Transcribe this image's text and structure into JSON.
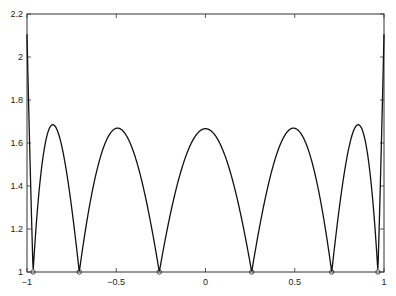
{
  "chart_data": {
    "type": "line",
    "title": "",
    "xlabel": "",
    "ylabel": "",
    "xlim": [
      -1,
      1
    ],
    "ylim": [
      1,
      2.2
    ],
    "grid": false,
    "legend": null,
    "x_ticks": [
      "-1",
      "-0.5",
      "0",
      "0.5",
      "1"
    ],
    "x_tick_values": [
      -1,
      -0.5,
      0,
      0.5,
      1
    ],
    "y_ticks": [
      "1",
      "1.2",
      "1.4",
      "1.6",
      "1.8",
      "2",
      "2.2"
    ],
    "y_tick_values": [
      1,
      1.2,
      1.4,
      1.6,
      1.8,
      2,
      2.2
    ],
    "series": [
      {
        "name": "Lebesgue function (Chebyshev roots, 6 nodes)",
        "kind": "curve",
        "color": "#000000",
        "nodes": [
          -0.9659,
          -0.7071,
          -0.2588,
          0.2588,
          0.7071,
          0.9659
        ],
        "approx_points": [
          {
            "x": -1,
            "y": 2.17
          },
          {
            "x": -0.966,
            "y": 1.0
          },
          {
            "x": -0.85,
            "y": 1.685
          },
          {
            "x": -0.707,
            "y": 1.0
          },
          {
            "x": -0.49,
            "y": 1.665
          },
          {
            "x": -0.259,
            "y": 1.0
          },
          {
            "x": 0,
            "y": 1.665
          },
          {
            "x": 0.259,
            "y": 1.0
          },
          {
            "x": 0.49,
            "y": 1.665
          },
          {
            "x": 0.707,
            "y": 1.0
          },
          {
            "x": 0.85,
            "y": 1.685
          },
          {
            "x": 0.966,
            "y": 1.0
          },
          {
            "x": 1,
            "y": 2.17
          }
        ]
      },
      {
        "name": "Interpolation nodes",
        "kind": "markers",
        "marker": "circle",
        "x": [
          -0.9659,
          -0.7071,
          -0.2588,
          0.2588,
          0.7071,
          0.9659
        ],
        "y": [
          1,
          1,
          1,
          1,
          1,
          1
        ]
      }
    ]
  }
}
